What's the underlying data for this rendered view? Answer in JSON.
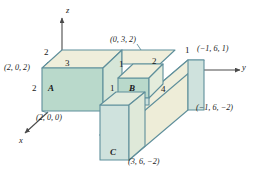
{
  "figure": {
    "colors": {
      "edge": "#5f8f9b",
      "top_face": "#efeedb",
      "front_face_green": "#b9d9cb",
      "side_face_blue": "#cfe2dd",
      "slab_face": "#eeedd8",
      "axis": "#4a4a4a",
      "text": "#1a1a1a",
      "background": "#ffffff"
    },
    "axes": [
      {
        "name": "z-axis",
        "label": "z"
      },
      {
        "name": "y-axis",
        "label": "y"
      },
      {
        "name": "x-axis",
        "label": "x"
      }
    ],
    "face_labels": [
      {
        "name": "face-a",
        "label": "A"
      },
      {
        "name": "face-b",
        "label": "B"
      },
      {
        "name": "face-c",
        "label": "C"
      }
    ],
    "dimensions": [
      {
        "name": "dim-top-left-2",
        "label": "2"
      },
      {
        "name": "dim-height-3",
        "label": "3"
      },
      {
        "name": "dim-left-2",
        "label": "2"
      },
      {
        "name": "dim-mid-1-upper",
        "label": "1"
      },
      {
        "name": "dim-mid-1-lower",
        "label": "1"
      },
      {
        "name": "dim-top-2",
        "label": "2"
      },
      {
        "name": "dim-right-1",
        "label": "1"
      },
      {
        "name": "dim-slab-4",
        "label": "4"
      }
    ],
    "coordinates": [
      {
        "name": "point-2-0-2",
        "label": "(2, 0, 2)"
      },
      {
        "name": "point-2-0-0",
        "label": "(2, 0, 0)"
      },
      {
        "name": "point-0-3-2",
        "label": "(0, 3, 2)"
      },
      {
        "name": "point-n1-6-1",
        "label": "(−1, 6, 1)"
      },
      {
        "name": "point-n1-6-n2",
        "label": "(−1, 6, −2)"
      },
      {
        "name": "point-3-6-n2",
        "label": "(3, 6, −2)"
      }
    ]
  }
}
